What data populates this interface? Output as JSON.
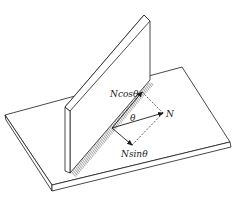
{
  "diagram": {
    "type": "physics-force-decomposition",
    "labels": {
      "n_cos": "Ncosθ",
      "n": "N",
      "theta": "θ",
      "n_sin": "Nsinθ"
    },
    "colors": {
      "line": "#1a1a1a",
      "background": "#ffffff"
    }
  }
}
